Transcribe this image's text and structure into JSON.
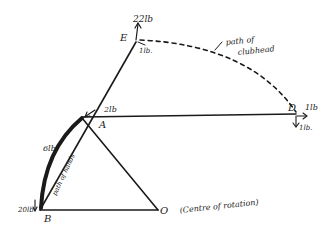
{
  "diagram": {
    "points": {
      "E": {
        "label": "E",
        "x": 136,
        "y": 42
      },
      "A": {
        "label": "A",
        "x": 82,
        "y": 118
      },
      "B": {
        "label": "B",
        "x": 40,
        "y": 210
      },
      "O": {
        "label": "O",
        "x": 158,
        "y": 210
      },
      "D": {
        "label": "D",
        "x": 296,
        "y": 114
      }
    },
    "forces": {
      "E_up": "22lb",
      "E_side": "1lb.",
      "A": "2lb",
      "D_right": "1lb",
      "D_down": "1lb.",
      "hands_top": "6lb",
      "B": "20lb"
    },
    "annotations": {
      "clubhead_path_line1": "path of",
      "clubhead_path_line2": "clubhead",
      "hands_path": "path of hands",
      "centre": "(Centre of rotation)"
    },
    "colors": {
      "ink": "#1a1a1a",
      "background": "#ffffff"
    }
  }
}
